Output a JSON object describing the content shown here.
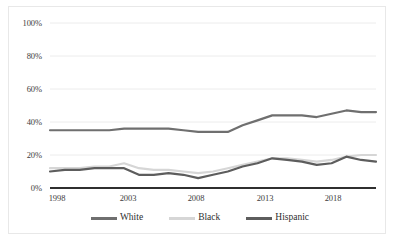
{
  "chart_data": {
    "type": "line",
    "title": "",
    "subtitle": "",
    "xlabel": "",
    "ylabel": "",
    "xlim": [
      1998,
      2020
    ],
    "ylim": [
      0,
      100
    ],
    "grid": true,
    "legend_position": "bottom",
    "x": [
      1998,
      1999,
      2000,
      2001,
      2002,
      2003,
      2004,
      2005,
      2006,
      2007,
      2008,
      2009,
      2010,
      2011,
      2012,
      2013,
      2014,
      2015,
      2016,
      2017,
      2018,
      2019,
      2020
    ],
    "xtick_labels": [
      "1998",
      "2003",
      "2008",
      "2013",
      "2018"
    ],
    "xticks": [
      1998,
      2003,
      2008,
      2013,
      2018
    ],
    "ytick_labels": [
      "0%",
      "20%",
      "40%",
      "60%",
      "80%",
      "100%"
    ],
    "yticks": [
      0,
      20,
      40,
      60,
      80,
      100
    ],
    "series": [
      {
        "name": "White",
        "color": "#6f6f6f",
        "values": [
          35,
          35,
          35,
          35,
          35,
          36,
          36,
          36,
          36,
          35,
          34,
          34,
          34,
          38,
          41,
          44,
          44,
          44,
          43,
          45,
          47,
          46,
          46
        ]
      },
      {
        "name": "Black",
        "color": "#d6d6d6",
        "values": [
          12,
          12,
          12,
          13,
          13,
          15,
          12,
          11,
          11,
          10,
          9,
          10,
          12,
          14,
          16,
          18,
          18,
          17,
          16,
          17,
          19,
          20,
          20
        ]
      },
      {
        "name": "Hispanic",
        "color": "#5d5d5d",
        "values": [
          10,
          11,
          11,
          12,
          12,
          12,
          8,
          8,
          9,
          8,
          6,
          8,
          10,
          13,
          15,
          18,
          17,
          16,
          14,
          15,
          19,
          17,
          16
        ]
      }
    ]
  },
  "legend": {
    "items": [
      {
        "label": "White",
        "color": "#6f6f6f"
      },
      {
        "label": "Black",
        "color": "#d6d6d6"
      },
      {
        "label": "Hispanic",
        "color": "#5d5d5d"
      }
    ]
  },
  "axis": {
    "y_labels": [
      "100%",
      "80%",
      "60%",
      "40%",
      "20%",
      "0%"
    ],
    "x_labels": [
      "1998",
      "2003",
      "2008",
      "2013",
      "2018"
    ]
  },
  "colors": {
    "gridline": "#ececec",
    "baseline": "#2f2f2f",
    "border": "#e8e8e8",
    "text": "#3d3d3d",
    "background": "#ffffff"
  }
}
